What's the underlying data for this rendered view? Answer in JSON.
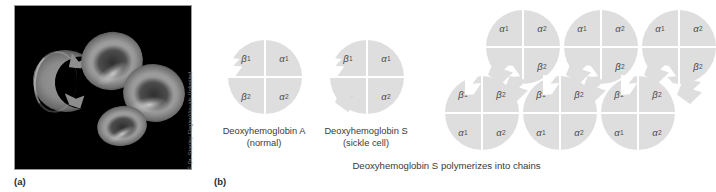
{
  "figure": {
    "panels": [
      {
        "id": "a",
        "label": "(a)"
      },
      {
        "id": "b",
        "label": "(b)"
      }
    ]
  },
  "micrograph": {
    "credit": "© Dr. Stanley Flegler/Visuals Unlimited",
    "background_color": "#000000",
    "cells": [
      {
        "name": "sickled-erythrocyte",
        "shape": "crescent"
      },
      {
        "name": "normal-erythrocyte",
        "shape": "biconcave-disc"
      },
      {
        "name": "normal-erythrocyte",
        "shape": "biconcave-disc"
      },
      {
        "name": "normal-erythrocyte",
        "shape": "biconcave-disc"
      }
    ]
  },
  "subunits": {
    "alpha1": "α",
    "alpha1_sub": "1",
    "alpha2": "α",
    "alpha2_sub": "2",
    "beta1": "β",
    "beta1_sub": "1",
    "beta2": "β",
    "beta2_sub": "2"
  },
  "molecules": {
    "deoxy_a": {
      "caption_line1": "Deoxyhemoglobin A",
      "caption_line2": "(normal)",
      "quadrants": {
        "top_left": "β",
        "top_left_sub": "1",
        "top_right": "α",
        "top_right_sub": "1",
        "bottom_left": "β",
        "bottom_left_sub": "2",
        "bottom_right": "α",
        "bottom_right_sub": "2"
      },
      "features": [
        "notch"
      ]
    },
    "deoxy_s": {
      "caption_line1": "Deoxyhemoglobin S",
      "caption_line2": "(sickle cell)",
      "quadrants": {
        "top_left": "β",
        "top_left_sub": "1",
        "top_right": "α",
        "top_right_sub": "1",
        "bottom_left": "β",
        "bottom_left_sub": "2",
        "bottom_right": "α",
        "bottom_right_sub": "2"
      },
      "features": [
        "notch",
        "tab"
      ]
    }
  },
  "polymer": {
    "caption": "Deoxyhemoglobin S polymerizes into chains",
    "top_row": [
      {
        "top_left": "α",
        "top_left_sub": "1",
        "top_right": "α",
        "top_right_sub": "2",
        "bottom_left": "β",
        "bottom_left_sub": "1",
        "bottom_right": "β",
        "bottom_right_sub": "2"
      },
      {
        "top_left": "α",
        "top_left_sub": "1",
        "top_right": "α",
        "top_right_sub": "2",
        "bottom_left": "β",
        "bottom_left_sub": "1",
        "bottom_right": "β",
        "bottom_right_sub": "2"
      },
      {
        "top_left": "α",
        "top_left_sub": "1",
        "top_right": "α",
        "top_right_sub": "2",
        "bottom_left": "β",
        "bottom_left_sub": "1",
        "bottom_right": "β",
        "bottom_right_sub": "2"
      }
    ],
    "bottom_row": [
      {
        "top_left": "β",
        "top_left_sub": "1",
        "top_right": "β",
        "top_right_sub": "2",
        "bottom_left": "α",
        "bottom_left_sub": "1",
        "bottom_right": "α",
        "bottom_right_sub": "2"
      },
      {
        "top_left": "β",
        "top_left_sub": "1",
        "top_right": "β",
        "top_right_sub": "2",
        "bottom_left": "α",
        "bottom_left_sub": "1",
        "bottom_right": "α",
        "bottom_right_sub": "2"
      },
      {
        "top_left": "β",
        "top_left_sub": "1",
        "top_right": "β",
        "top_right_sub": "2",
        "bottom_left": "α",
        "bottom_left_sub": "1",
        "bottom_right": "α",
        "bottom_right_sub": "2"
      }
    ]
  },
  "colors": {
    "molecule_fill": "#dedede",
    "divider": "#ffffff",
    "subunit_text": "#4a4a4a",
    "caption_text": "#3a3a3a",
    "credit_text": "#7e7e7e"
  }
}
